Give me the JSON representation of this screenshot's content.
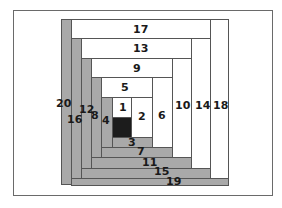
{
  "diagram": {
    "colors": {
      "light": "#ffffff",
      "dark": "#a9a9a9",
      "center": "#1c1c1c",
      "outline": "#555555"
    },
    "strips": [
      {
        "id": "20",
        "label": "20",
        "shade": "dark",
        "x": 61,
        "y": 19,
        "w": 11,
        "h": 166,
        "lx": 56,
        "ly": 98
      },
      {
        "id": "17",
        "label": "17",
        "shade": "light",
        "x": 71,
        "y": 19,
        "w": 158,
        "h": 20,
        "lx": 133,
        "ly": 24
      },
      {
        "id": "18",
        "label": "18",
        "shade": "light",
        "x": 210,
        "y": 19,
        "w": 19,
        "h": 160,
        "lx": 213,
        "ly": 100
      },
      {
        "id": "19",
        "label": "19",
        "shade": "dark",
        "x": 71,
        "y": 178,
        "w": 158,
        "h": 8,
        "lx": 166,
        "ly": 176
      },
      {
        "id": "16",
        "label": "16",
        "shade": "dark",
        "x": 71,
        "y": 38,
        "w": 11,
        "h": 141,
        "lx": 67,
        "ly": 114
      },
      {
        "id": "13",
        "label": "13",
        "shade": "light",
        "x": 81,
        "y": 38,
        "w": 130,
        "h": 21,
        "lx": 133,
        "ly": 43
      },
      {
        "id": "14",
        "label": "14",
        "shade": "light",
        "x": 191,
        "y": 38,
        "w": 20,
        "h": 131,
        "lx": 195,
        "ly": 100
      },
      {
        "id": "15",
        "label": "15",
        "shade": "dark",
        "x": 81,
        "y": 168,
        "w": 130,
        "h": 11,
        "lx": 154,
        "ly": 166
      },
      {
        "id": "12",
        "label": "12",
        "shade": "dark",
        "x": 81,
        "y": 58,
        "w": 11,
        "h": 111,
        "lx": 79,
        "ly": 104
      },
      {
        "id": "9",
        "label": "9",
        "shade": "light",
        "x": 91,
        "y": 58,
        "w": 101,
        "h": 20,
        "lx": 133,
        "ly": 63
      },
      {
        "id": "10",
        "label": "10",
        "shade": "light",
        "x": 172,
        "y": 58,
        "w": 20,
        "h": 100,
        "lx": 175,
        "ly": 100
      },
      {
        "id": "11",
        "label": "11",
        "shade": "dark",
        "x": 91,
        "y": 157,
        "w": 101,
        "h": 12,
        "lx": 142,
        "ly": 157
      },
      {
        "id": "8",
        "label": "8",
        "shade": "dark",
        "x": 91,
        "y": 77,
        "w": 11,
        "h": 81,
        "lx": 91,
        "ly": 110
      },
      {
        "id": "5",
        "label": "5",
        "shade": "light",
        "x": 101,
        "y": 77,
        "w": 52,
        "h": 21,
        "lx": 121,
        "ly": 82
      },
      {
        "id": "6",
        "label": "6",
        "shade": "light",
        "x": 152,
        "y": 77,
        "w": 21,
        "h": 71,
        "lx": 158,
        "ly": 110
      },
      {
        "id": "7",
        "label": "7",
        "shade": "dark",
        "x": 101,
        "y": 147,
        "w": 72,
        "h": 11,
        "lx": 137,
        "ly": 146
      },
      {
        "id": "4",
        "label": "4",
        "shade": "dark",
        "x": 101,
        "y": 97,
        "w": 12,
        "h": 51,
        "lx": 102,
        "ly": 115
      },
      {
        "id": "1",
        "label": "1",
        "shade": "light",
        "x": 112,
        "y": 97,
        "w": 20,
        "h": 21,
        "lx": 119,
        "ly": 102
      },
      {
        "id": "1b",
        "label": "",
        "shade": "center",
        "x": 112,
        "y": 117,
        "w": 20,
        "h": 21,
        "lx": 0,
        "ly": 0
      },
      {
        "id": "2",
        "label": "2",
        "shade": "light",
        "x": 131,
        "y": 97,
        "w": 22,
        "h": 41,
        "lx": 138,
        "ly": 111
      },
      {
        "id": "3",
        "label": "3",
        "shade": "dark",
        "x": 112,
        "y": 137,
        "w": 41,
        "h": 11,
        "lx": 128,
        "ly": 137
      }
    ]
  }
}
